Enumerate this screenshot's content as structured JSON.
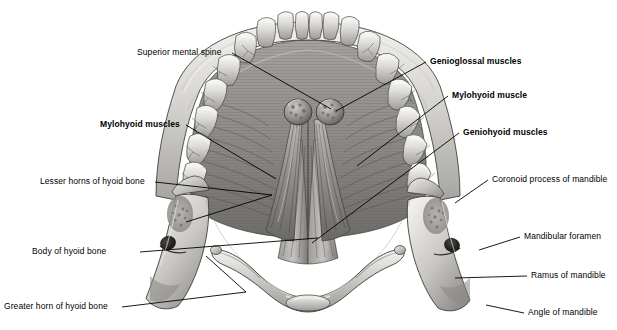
{
  "figure": {
    "background_color": "#ffffff",
    "line_color": "#000000",
    "width": 617,
    "height": 330
  },
  "labels": [
    {
      "id": "superior-mental-spine",
      "text": "Superior mental spine",
      "weight": "regular",
      "side": "left",
      "x": 137,
      "y": 47,
      "anchor_x": 232,
      "anchor_y": 53,
      "target_x": 331,
      "target_y": 109
    },
    {
      "id": "mylohyoid-muscles-left",
      "text": "Mylohyoid muscles",
      "weight": "bold",
      "side": "left",
      "x": 100,
      "y": 119,
      "anchor_x": 186,
      "anchor_y": 125,
      "target_x": 276,
      "target_y": 179
    },
    {
      "id": "lesser-horns-of-hyoid-bone",
      "text": "Lesser horns of hyoid bone",
      "weight": "regular",
      "side": "left",
      "x": 40,
      "y": 176,
      "anchor_x": 155,
      "anchor_y": 182,
      "target_x": 272,
      "target_y": 195
    },
    {
      "id": "body-of-hyoid-bone",
      "text": "Body of hyoid bone",
      "weight": "regular",
      "side": "left",
      "x": 32,
      "y": 246,
      "anchor_x": 140,
      "anchor_y": 252,
      "target_x": 318,
      "target_y": 238
    },
    {
      "id": "greater-horn-of-hyoid-bone",
      "text": "Greater horn of hyoid bone",
      "weight": "regular",
      "side": "left",
      "x": 4,
      "y": 301,
      "anchor_x": 122,
      "anchor_y": 307,
      "target_x": 246,
      "target_y": 292
    },
    {
      "id": "genioglossal-muscles",
      "text": "Genioglossal muscles",
      "weight": "bold",
      "side": "right",
      "x": 430,
      "y": 56,
      "anchor_x": 426,
      "anchor_y": 62,
      "target_x": 336,
      "target_y": 111
    },
    {
      "id": "mylohyoid-muscle-right",
      "text": "Mylohyoid muscle",
      "weight": "bold",
      "side": "right",
      "x": 452,
      "y": 90,
      "anchor_x": 448,
      "anchor_y": 96,
      "target_x": 357,
      "target_y": 166
    },
    {
      "id": "geniohyoid-muscles",
      "text": "Geniohyoid muscles",
      "weight": "bold",
      "side": "right",
      "x": 463,
      "y": 127,
      "anchor_x": 459,
      "anchor_y": 133,
      "target_x": 312,
      "target_y": 243
    },
    {
      "id": "coronoid-process-of-mandible",
      "text": "Coronoid process of mandible",
      "weight": "regular",
      "side": "right",
      "x": 492,
      "y": 174,
      "anchor_x": 488,
      "anchor_y": 180,
      "target_x": 455,
      "target_y": 203
    },
    {
      "id": "mandibular-foramen",
      "text": "Mandibular foramen",
      "weight": "regular",
      "side": "right",
      "x": 524,
      "y": 231,
      "anchor_x": 520,
      "anchor_y": 237,
      "target_x": 479,
      "target_y": 250
    },
    {
      "id": "ramus-of-mandible",
      "text": "Ramus of mandible",
      "weight": "regular",
      "side": "right",
      "x": 531,
      "y": 270,
      "anchor_x": 527,
      "anchor_y": 276,
      "target_x": 455,
      "target_y": 278
    },
    {
      "id": "angle-of-mandible",
      "text": "Angle of mandible",
      "weight": "regular",
      "side": "right",
      "x": 528,
      "y": 307,
      "anchor_x": 524,
      "anchor_y": 313,
      "target_x": 486,
      "target_y": 305
    }
  ],
  "structures": {
    "mandible": "mandible-bone",
    "teeth": "dental-arch-teeth",
    "hyoid": "hyoid-bone",
    "genioglossus": "genioglossal-muscle-pair",
    "mylohyoid": "mylohyoid-muscle-sheet",
    "geniohyoid": "geniohyoid-muscle-pair",
    "genial_tubercles": "genial-tubercles",
    "mandibular_foramen": "mandibular-foramen-opening",
    "coronoid": "coronoid-process",
    "ramus": "mandibular-ramus",
    "angle": "mandibular-angle"
  }
}
